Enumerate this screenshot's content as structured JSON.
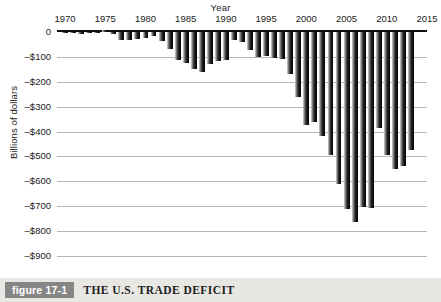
{
  "figure": {
    "number_label": "figure 17-1",
    "title": "THE U.S. TRADE DEFICIT",
    "caption_bg": "#e9e7e4",
    "number_badge_bg": "#868686"
  },
  "chart_data": {
    "type": "bar",
    "title": "THE U.S. TRADE DEFICIT",
    "xlabel": "Year",
    "ylabel": "Billions of dollars",
    "ylim": [
      -900,
      0
    ],
    "xlim": [
      1969,
      2015
    ],
    "grid": true,
    "legend": null,
    "y_tick_labels": [
      "0",
      "–$100",
      "–$200",
      "–$300",
      "–$400",
      "–$500",
      "–$600",
      "–$700",
      "–$800",
      "–$900"
    ],
    "y_tick_values": [
      0,
      -100,
      -200,
      -300,
      -400,
      -500,
      -600,
      -700,
      -800,
      -900
    ],
    "x_tick_labels": [
      "1970",
      "1975",
      "1980",
      "1985",
      "1990",
      "1995",
      "2000",
      "2005",
      "2010",
      "2015"
    ],
    "x_tick_values": [
      1970,
      1975,
      1980,
      1985,
      1990,
      1995,
      2000,
      2005,
      2010,
      2015
    ],
    "bar_color": "#151515",
    "categories": [
      1970,
      1971,
      1972,
      1973,
      1974,
      1975,
      1976,
      1977,
      1978,
      1979,
      1980,
      1981,
      1982,
      1983,
      1984,
      1985,
      1986,
      1987,
      1988,
      1989,
      1990,
      1991,
      1992,
      1993,
      1994,
      1995,
      1996,
      1997,
      1998,
      1999,
      2000,
      2001,
      2002,
      2003,
      2004,
      2005,
      2006,
      2007,
      2008,
      2009,
      2010,
      2011,
      2012,
      2013
    ],
    "values": [
      -2,
      -3,
      -7,
      -1,
      -6,
      8,
      -9,
      -31,
      -34,
      -28,
      -26,
      -17,
      -37,
      -68,
      -112,
      -123,
      -147,
      -161,
      -127,
      -116,
      -111,
      -32,
      -40,
      -71,
      -100,
      -97,
      -104,
      -108,
      -167,
      -260,
      -372,
      -362,
      -419,
      -495,
      -609,
      -712,
      -762,
      -705,
      -709,
      -384,
      -495,
      -549,
      -537,
      -476
    ],
    "source_note": null
  },
  "axes": {
    "x_axis_title": "Year",
    "y_axis_title": "Billions of dollars"
  }
}
